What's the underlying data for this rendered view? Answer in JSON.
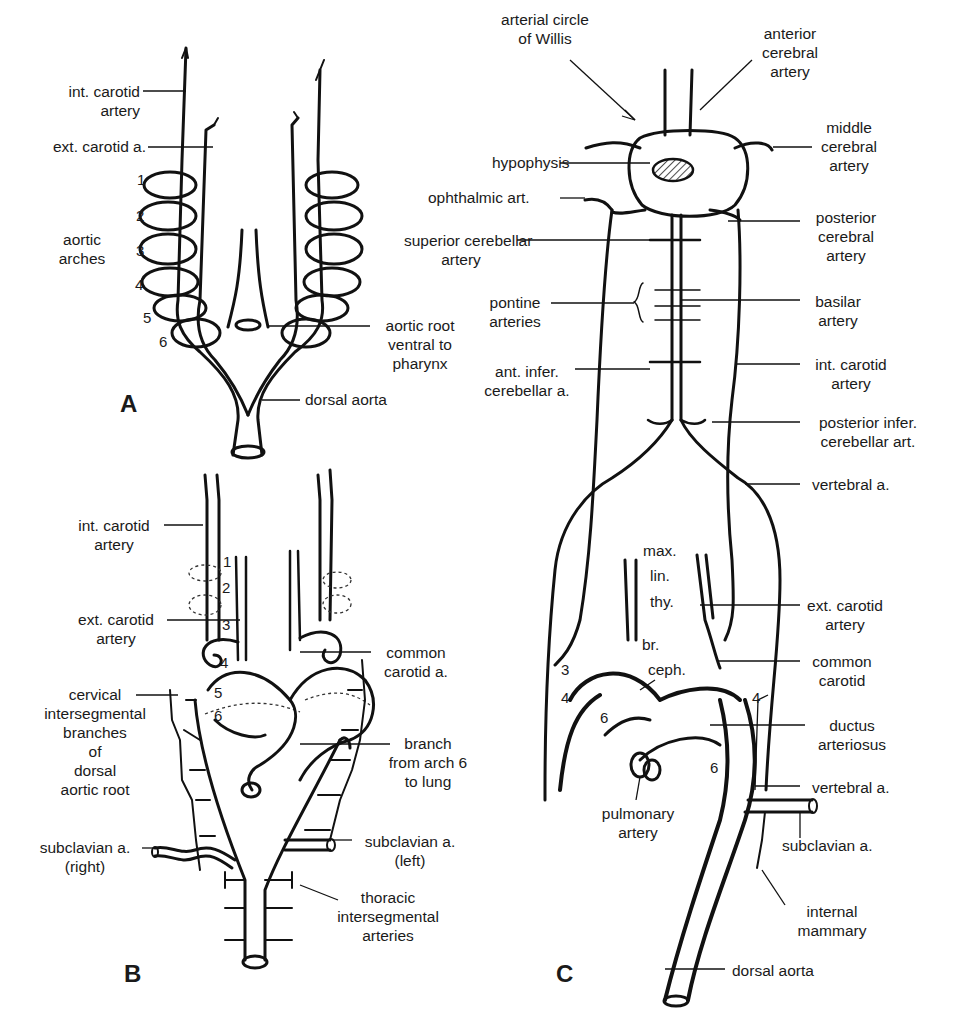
{
  "figure": {
    "panels": [
      {
        "id": "A",
        "letter": "A"
      },
      {
        "id": "B",
        "letter": "B"
      },
      {
        "id": "C",
        "letter": "C"
      }
    ]
  },
  "panel_a": {
    "labels": {
      "int_carotid": "int. carotid\nartery",
      "ext_carotid": "ext. carotid a.",
      "aortic_arches": "aortic\narches",
      "aortic_root": "aortic root\nventral to\npharynx",
      "dorsal_aorta": "dorsal aorta"
    },
    "arch_numbers": [
      "1",
      "2",
      "3",
      "4",
      "5",
      "6"
    ]
  },
  "panel_b": {
    "labels": {
      "int_carotid": "int. carotid\nartery",
      "ext_carotid": "ext. carotid\nartery",
      "cervical": "cervical\nintersegmental\nbranches\nof\ndorsal\naortic root",
      "subclavian_right": "subclavian a.\n(right)",
      "common_carotid": "common\ncarotid a.",
      "branch_arch6": "branch\nfrom arch 6\nto lung",
      "subclavian_left": "subclavian a.\n(left)",
      "thoracic": "thoracic\nintersegmental\narteries"
    },
    "arch_numbers": [
      "1",
      "2",
      "3",
      "4",
      "5",
      "6"
    ]
  },
  "panel_c": {
    "labels": {
      "circle_willis": "arterial circle\nof Willis",
      "anterior_cerebral": "anterior\ncerebral\nartery",
      "middle_cerebral": "middle\ncerebral\nartery",
      "hypophysis": "hypophysis",
      "ophthalmic": "ophthalmic art.",
      "posterior_cerebral": "posterior\ncerebral\nartery",
      "superior_cerebellar": "superior cerebellar\nartery",
      "pontine": "pontine\narteries",
      "basilar": "basilar\nartery",
      "ant_infer_cerebellar": "ant. infer.\ncerebellar a.",
      "int_carotid": "int. carotid\nartery",
      "post_infer_cerebellar": "posterior infer.\ncerebellar art.",
      "vertebral_upper": "vertebral a.",
      "max": "max.",
      "lin": "lin.",
      "thy": "thy.",
      "ext_carotid": "ext. carotid\nartery",
      "br": "br.",
      "ceph": "ceph.",
      "common_carotid": "common\ncarotid",
      "ductus": "ductus\narteriosus",
      "vertebral_lower": "vertebral a.",
      "pulmonary": "pulmonary\nartery",
      "subclavian": "subclavian a.",
      "internal_mammary": "internal\nmammary",
      "dorsal_aorta": "dorsal aorta"
    },
    "arch_numbers": {
      "left_3": "3",
      "left_4": "4",
      "right_4": "4",
      "left_6": "6",
      "right_6": "6"
    }
  }
}
